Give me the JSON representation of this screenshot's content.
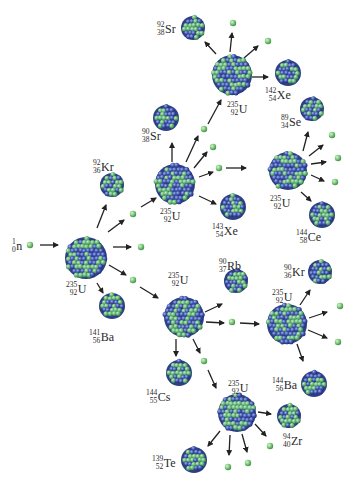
{
  "diagram": {
    "colors": {
      "proton": "#3a4fa8",
      "neutron_nucleon": "#4ea86a",
      "free_neutron": "#6fbf6a",
      "arrow": "#222222",
      "background": "#ffffff"
    },
    "incoming_neutron": {
      "id": "n0",
      "label": {
        "mass": "1",
        "atomic": "0",
        "symbol": "n"
      },
      "x": 30,
      "y": 245
    },
    "nuclei": [
      {
        "id": "U1",
        "type": "fissile",
        "x": 86,
        "y": 258,
        "r": 21,
        "label": {
          "mass": "235",
          "atomic": "92",
          "symbol": "U"
        },
        "lx": 66,
        "ly": 280
      },
      {
        "id": "Kr92",
        "type": "fragment",
        "x": 112,
        "y": 185,
        "r": 12,
        "label": {
          "mass": "92",
          "atomic": "36",
          "symbol": "Kr"
        },
        "lx": 93,
        "ly": 158
      },
      {
        "id": "Ba141",
        "type": "fragment",
        "x": 112,
        "y": 306,
        "r": 13,
        "label": {
          "mass": "141",
          "atomic": "56",
          "symbol": "Ba"
        },
        "lx": 89,
        "ly": 328
      },
      {
        "id": "U2",
        "type": "fissile",
        "x": 175,
        "y": 184,
        "r": 20,
        "label": {
          "mass": "235",
          "atomic": "92",
          "symbol": "U"
        },
        "lx": 160,
        "ly": 207
      },
      {
        "id": "Sr90",
        "type": "fragment",
        "x": 166,
        "y": 118,
        "r": 13,
        "label": {
          "mass": "90",
          "atomic": "38",
          "symbol": "Sr"
        },
        "lx": 142,
        "ly": 127
      },
      {
        "id": "Xe143",
        "type": "fragment",
        "x": 233,
        "y": 207,
        "r": 13,
        "label": {
          "mass": "143",
          "atomic": "54",
          "symbol": "Xe"
        },
        "lx": 212,
        "ly": 222
      },
      {
        "id": "U3",
        "type": "fissile",
        "x": 232,
        "y": 75,
        "r": 20,
        "label": {
          "mass": "235",
          "atomic": "92",
          "symbol": "U"
        },
        "lx": 227,
        "ly": 100
      },
      {
        "id": "Sr92",
        "type": "fragment",
        "x": 193,
        "y": 28,
        "r": 12,
        "label": {
          "mass": "92",
          "atomic": "38",
          "symbol": "Sr"
        },
        "lx": 157,
        "ly": 20
      },
      {
        "id": "Xe142",
        "type": "fragment",
        "x": 288,
        "y": 73,
        "r": 13,
        "label": {
          "mass": "142",
          "atomic": "54",
          "symbol": "Xe"
        },
        "lx": 265,
        "ly": 86
      },
      {
        "id": "U4",
        "type": "fissile",
        "x": 288,
        "y": 171,
        "r": 19,
        "label": {
          "mass": "235",
          "atomic": "92",
          "symbol": "U"
        },
        "lx": 270,
        "ly": 194
      },
      {
        "id": "Se89",
        "type": "fragment",
        "x": 312,
        "y": 109,
        "r": 12,
        "label": {
          "mass": "89",
          "atomic": "34",
          "symbol": "Se"
        },
        "lx": 281,
        "ly": 113
      },
      {
        "id": "Ce144",
        "type": "fragment",
        "x": 322,
        "y": 215,
        "r": 13,
        "label": {
          "mass": "144",
          "atomic": "58",
          "symbol": "Ce"
        },
        "lx": 296,
        "ly": 228
      },
      {
        "id": "U5",
        "type": "fissile",
        "x": 184,
        "y": 317,
        "r": 20,
        "label": {
          "mass": "235",
          "atomic": "92",
          "symbol": "U"
        },
        "lx": 168,
        "ly": 271
      },
      {
        "id": "Rb90",
        "type": "fragment",
        "x": 236,
        "y": 281,
        "r": 12,
        "label": {
          "mass": "90",
          "atomic": "37",
          "symbol": "Rb"
        },
        "lx": 219,
        "ly": 257
      },
      {
        "id": "Cs144",
        "type": "fragment",
        "x": 179,
        "y": 373,
        "r": 13,
        "label": {
          "mass": "144",
          "atomic": "55",
          "symbol": "Cs"
        },
        "lx": 146,
        "ly": 388
      },
      {
        "id": "U6",
        "type": "fissile",
        "x": 287,
        "y": 324,
        "r": 20,
        "label": {
          "mass": "235",
          "atomic": "92",
          "symbol": "U"
        },
        "lx": 272,
        "ly": 288
      },
      {
        "id": "Kr90",
        "type": "fragment",
        "x": 320,
        "y": 272,
        "r": 12,
        "label": {
          "mass": "90",
          "atomic": "36",
          "symbol": "Kr"
        },
        "lx": 284,
        "ly": 263
      },
      {
        "id": "Ba144",
        "type": "fragment",
        "x": 314,
        "y": 384,
        "r": 13,
        "label": {
          "mass": "144",
          "atomic": "56",
          "symbol": "Ba"
        },
        "lx": 272,
        "ly": 376
      },
      {
        "id": "U7",
        "type": "fissile",
        "x": 237,
        "y": 413,
        "r": 19,
        "label": {
          "mass": "235",
          "atomic": "92",
          "symbol": "U"
        },
        "lx": 228,
        "ly": 379
      },
      {
        "id": "Zr94",
        "type": "fragment",
        "x": 289,
        "y": 416,
        "r": 12,
        "label": {
          "mass": "94",
          "atomic": "40",
          "symbol": "Zr"
        },
        "lx": 283,
        "ly": 432
      },
      {
        "id": "Te139",
        "type": "fragment",
        "x": 194,
        "y": 460,
        "r": 13,
        "label": {
          "mass": "139",
          "atomic": "52",
          "symbol": "Te"
        },
        "lx": 152,
        "ly": 454
      }
    ],
    "free_neutrons": [
      {
        "x": 133,
        "y": 214
      },
      {
        "x": 141,
        "y": 247
      },
      {
        "x": 133,
        "y": 280
      },
      {
        "x": 204,
        "y": 129
      },
      {
        "x": 213,
        "y": 147
      },
      {
        "x": 219,
        "y": 168
      },
      {
        "x": 233,
        "y": 23
      },
      {
        "x": 268,
        "y": 41
      },
      {
        "x": 332,
        "y": 135
      },
      {
        "x": 338,
        "y": 158
      },
      {
        "x": 335,
        "y": 182
      },
      {
        "x": 232,
        "y": 322
      },
      {
        "x": 204,
        "y": 361
      },
      {
        "x": 340,
        "y": 306
      },
      {
        "x": 338,
        "y": 342
      },
      {
        "x": 270,
        "y": 446
      },
      {
        "x": 248,
        "y": 463
      },
      {
        "x": 228,
        "y": 467
      }
    ],
    "arrows": [
      {
        "x1": 40,
        "y1": 245,
        "x2": 58,
        "y2": 245
      },
      {
        "x1": 97,
        "y1": 228,
        "x2": 106,
        "y2": 205
      },
      {
        "x1": 108,
        "y1": 232,
        "x2": 124,
        "y2": 220
      },
      {
        "x1": 113,
        "y1": 247,
        "x2": 131,
        "y2": 247
      },
      {
        "x1": 109,
        "y1": 265,
        "x2": 126,
        "y2": 275
      },
      {
        "x1": 97,
        "y1": 283,
        "x2": 103,
        "y2": 293
      },
      {
        "x1": 141,
        "y1": 207,
        "x2": 156,
        "y2": 198
      },
      {
        "x1": 140,
        "y1": 287,
        "x2": 158,
        "y2": 298
      },
      {
        "x1": 172,
        "y1": 162,
        "x2": 172,
        "y2": 143
      },
      {
        "x1": 186,
        "y1": 162,
        "x2": 198,
        "y2": 136
      },
      {
        "x1": 194,
        "y1": 168,
        "x2": 207,
        "y2": 152
      },
      {
        "x1": 199,
        "y1": 177,
        "x2": 213,
        "y2": 172
      },
      {
        "x1": 199,
        "y1": 196,
        "x2": 216,
        "y2": 204
      },
      {
        "x1": 226,
        "y1": 168,
        "x2": 246,
        "y2": 168
      },
      {
        "x1": 208,
        "y1": 124,
        "x2": 221,
        "y2": 100
      },
      {
        "x1": 216,
        "y1": 54,
        "x2": 205,
        "y2": 42
      },
      {
        "x1": 230,
        "y1": 52,
        "x2": 232,
        "y2": 33
      },
      {
        "x1": 244,
        "y1": 58,
        "x2": 258,
        "y2": 46
      },
      {
        "x1": 252,
        "y1": 77,
        "x2": 268,
        "y2": 77
      },
      {
        "x1": 303,
        "y1": 151,
        "x2": 308,
        "y2": 132
      },
      {
        "x1": 309,
        "y1": 156,
        "x2": 323,
        "y2": 145
      },
      {
        "x1": 311,
        "y1": 164,
        "x2": 326,
        "y2": 162
      },
      {
        "x1": 311,
        "y1": 175,
        "x2": 324,
        "y2": 181
      },
      {
        "x1": 301,
        "y1": 192,
        "x2": 311,
        "y2": 201
      },
      {
        "x1": 205,
        "y1": 312,
        "x2": 222,
        "y2": 304
      },
      {
        "x1": 206,
        "y1": 322,
        "x2": 224,
        "y2": 323
      },
      {
        "x1": 240,
        "y1": 323,
        "x2": 259,
        "y2": 324
      },
      {
        "x1": 176,
        "y1": 339,
        "x2": 176,
        "y2": 356
      },
      {
        "x1": 193,
        "y1": 339,
        "x2": 200,
        "y2": 353
      },
      {
        "x1": 208,
        "y1": 370,
        "x2": 216,
        "y2": 388
      },
      {
        "x1": 300,
        "y1": 305,
        "x2": 310,
        "y2": 290
      },
      {
        "x1": 309,
        "y1": 318,
        "x2": 327,
        "y2": 312
      },
      {
        "x1": 308,
        "y1": 330,
        "x2": 327,
        "y2": 338
      },
      {
        "x1": 297,
        "y1": 344,
        "x2": 303,
        "y2": 361
      },
      {
        "x1": 258,
        "y1": 412,
        "x2": 271,
        "y2": 414
      },
      {
        "x1": 255,
        "y1": 424,
        "x2": 266,
        "y2": 436
      },
      {
        "x1": 242,
        "y1": 434,
        "x2": 247,
        "y2": 452
      },
      {
        "x1": 230,
        "y1": 435,
        "x2": 229,
        "y2": 455
      },
      {
        "x1": 220,
        "y1": 431,
        "x2": 208,
        "y2": 446
      }
    ]
  }
}
